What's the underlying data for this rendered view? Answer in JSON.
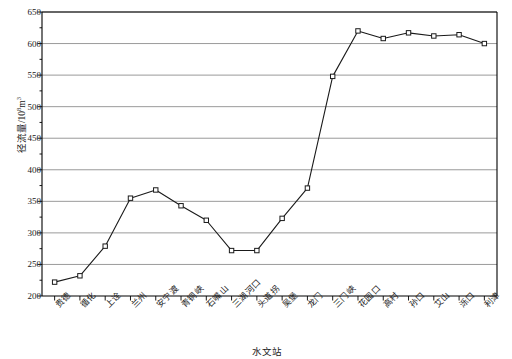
{
  "chart_data": {
    "type": "line",
    "title": "",
    "xlabel": "水文站",
    "ylabel_main": "径流量/10",
    "ylabel_exp": "8",
    "ylabel_tail": "m",
    "ylabel_exp2": "3",
    "ylabel_full": "径流量/10⁸m³",
    "categories": [
      "贵德",
      "循化",
      "上诠",
      "兰州",
      "安宁渡",
      "青铜峡",
      "石嘴山",
      "三湖河口",
      "头道拐",
      "吴堡",
      "龙门",
      "三门峡",
      "花园口",
      "高村",
      "孙口",
      "艾山",
      "泺口",
      "利津"
    ],
    "values": [
      222,
      232,
      279,
      355,
      368,
      343,
      320,
      272,
      272,
      323,
      371,
      548,
      620,
      608,
      617,
      612,
      614,
      600
    ],
    "series": [
      {
        "name": "径流量",
        "values": [
          222,
          232,
          279,
          355,
          368,
          343,
          320,
          272,
          272,
          323,
          371,
          548,
          620,
          608,
          617,
          612,
          614,
          600
        ]
      }
    ],
    "ylim": [
      200,
      650
    ],
    "ytick_labels": [
      "200",
      "250",
      "300",
      "350",
      "400",
      "450",
      "500",
      "550",
      "600",
      "650"
    ],
    "ytick_values": [
      200,
      250,
      300,
      350,
      400,
      450,
      500,
      550,
      600,
      650
    ],
    "ytick_minor_step": 25,
    "grid": true,
    "grid_axis": "y",
    "legend": "none",
    "marker": "open-square",
    "line_color": "#1a1a1a",
    "grid_color": "#808080",
    "axis_color": "#000000",
    "plot_bg": "#ffffff"
  }
}
